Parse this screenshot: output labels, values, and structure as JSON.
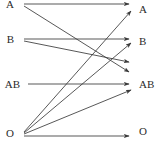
{
  "diagram": {
    "type": "bipartite-arrow-diagram",
    "title": "",
    "width": 162,
    "height": 150,
    "background_color": "#ffffff",
    "line_color": "#3a3a3a",
    "text_color": "#2b2b2b",
    "left_column": {
      "name": "donor-column",
      "nodes": [
        {
          "id": "left-a",
          "label": "A",
          "x": 14,
          "y": 4
        },
        {
          "id": "left-b",
          "label": "B",
          "x": 14,
          "y": 39
        },
        {
          "id": "left-ab",
          "label": "AB",
          "x": 20,
          "y": 84
        },
        {
          "id": "left-o",
          "label": "O",
          "x": 14,
          "y": 133
        }
      ]
    },
    "right_column": {
      "name": "recipient-column",
      "nodes": [
        {
          "id": "right-a",
          "label": "A",
          "x": 139,
          "y": 9
        },
        {
          "id": "right-b",
          "label": "B",
          "x": 139,
          "y": 41
        },
        {
          "id": "right-ab",
          "label": "AB",
          "x": 139,
          "y": 84
        },
        {
          "id": "right-o",
          "label": "O",
          "x": 139,
          "y": 131
        }
      ]
    },
    "edges": [
      {
        "name": "edge-a-to-a",
        "from": "left-a",
        "to": "right-a",
        "x1": 24,
        "y1": 4,
        "x2": 129,
        "y2": 4
      },
      {
        "name": "edge-a-to-ab",
        "from": "left-a",
        "to": "right-ab",
        "x1": 24,
        "y1": 6,
        "x2": 129,
        "y2": 72
      },
      {
        "name": "edge-b-to-b",
        "from": "left-b",
        "to": "right-b",
        "x1": 24,
        "y1": 39,
        "x2": 129,
        "y2": 39
      },
      {
        "name": "edge-b-to-ab",
        "from": "left-b",
        "to": "right-ab",
        "x1": 24,
        "y1": 41,
        "x2": 129,
        "y2": 62
      },
      {
        "name": "edge-ab-to-ab",
        "from": "left-ab",
        "to": "right-ab",
        "x1": 28,
        "y1": 84,
        "x2": 129,
        "y2": 84
      },
      {
        "name": "edge-o-to-a",
        "from": "left-o",
        "to": "right-a",
        "x1": 24,
        "y1": 132,
        "x2": 131,
        "y2": 11
      },
      {
        "name": "edge-o-to-b",
        "from": "left-o",
        "to": "right-b",
        "x1": 24,
        "y1": 133,
        "x2": 131,
        "y2": 43
      },
      {
        "name": "edge-o-to-ab",
        "from": "left-o",
        "to": "right-ab",
        "x1": 24,
        "y1": 134,
        "x2": 131,
        "y2": 90
      },
      {
        "name": "edge-o-to-o",
        "from": "left-o",
        "to": "right-o",
        "x1": 24,
        "y1": 136,
        "x2": 129,
        "y2": 136
      }
    ]
  }
}
